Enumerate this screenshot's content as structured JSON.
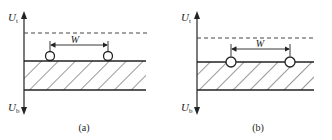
{
  "panels": [
    {
      "id": "a",
      "caption": "(a)",
      "axis_top_label": "U",
      "axis_top_sub": "t",
      "axis_bottom_label": "U",
      "axis_bottom_sub": "b",
      "width_label": "W",
      "description": "Two circles resting on top surface of hatched band, dashed level line above"
    },
    {
      "id": "b",
      "caption": "(b)",
      "axis_top_label": "U",
      "axis_top_sub": "t",
      "axis_bottom_label": "U",
      "axis_bottom_sub": "b",
      "width_label": "W",
      "description": "Two circles centered on top surface of hatched band, dashed level line above"
    }
  ]
}
